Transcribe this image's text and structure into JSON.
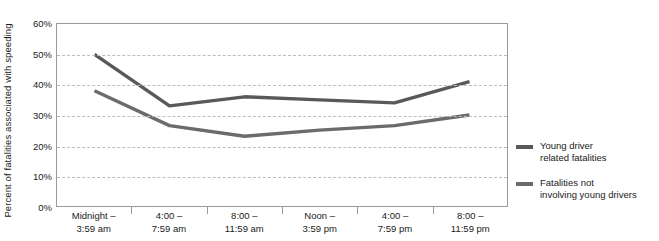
{
  "chart_data": {
    "type": "line",
    "title": "",
    "xlabel": "",
    "ylabel": "Percent of fatalities associated with speeding",
    "ylim": [
      0,
      60
    ],
    "ytick_labels": [
      "60%",
      "50%",
      "40%",
      "30%",
      "20%",
      "10%",
      "0%"
    ],
    "ytick_values": [
      60,
      50,
      40,
      30,
      20,
      10,
      0
    ],
    "grid": true,
    "legend_position": "right",
    "categories": [
      "Midnight –\n3:59 am",
      "4:00 –\n7:59 am",
      "8:00 –\n11:59 am",
      "Noon –\n3:59 pm",
      "4:00 –\n7:59 pm",
      "8:00 –\n11:59 pm"
    ],
    "series": [
      {
        "name": "Young driver\nrelated fatalities",
        "color": "#595959",
        "values": [
          50,
          33,
          36,
          35,
          34,
          41
        ]
      },
      {
        "name": "Fatalities not\ninvolving young drivers",
        "color": "#6b6b6b",
        "values": [
          38,
          26.5,
          23,
          25,
          26.5,
          30
        ]
      }
    ]
  },
  "legend": {
    "entries": [
      {
        "label": "Young driver\nrelated fatalities",
        "color": "#595959"
      },
      {
        "label": "Fatalities not\ninvolving young drivers",
        "color": "#6b6b6b"
      }
    ]
  }
}
